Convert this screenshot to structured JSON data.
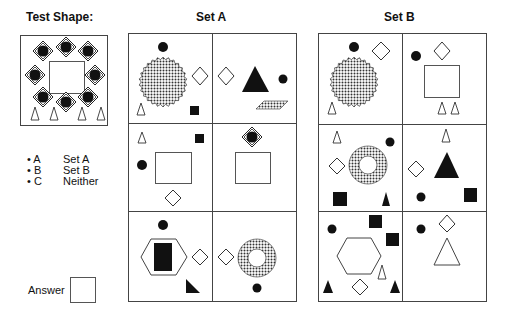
{
  "test_shape": {
    "title": "Test Shape:"
  },
  "set_a": {
    "title": "Set A"
  },
  "set_b": {
    "title": "Set B"
  },
  "options": [
    {
      "key": "A",
      "label": "Set A"
    },
    {
      "key": "B",
      "label": "Set B"
    },
    {
      "key": "C",
      "label": "Neither"
    }
  ],
  "answer": {
    "label": "Answer",
    "value": ""
  }
}
